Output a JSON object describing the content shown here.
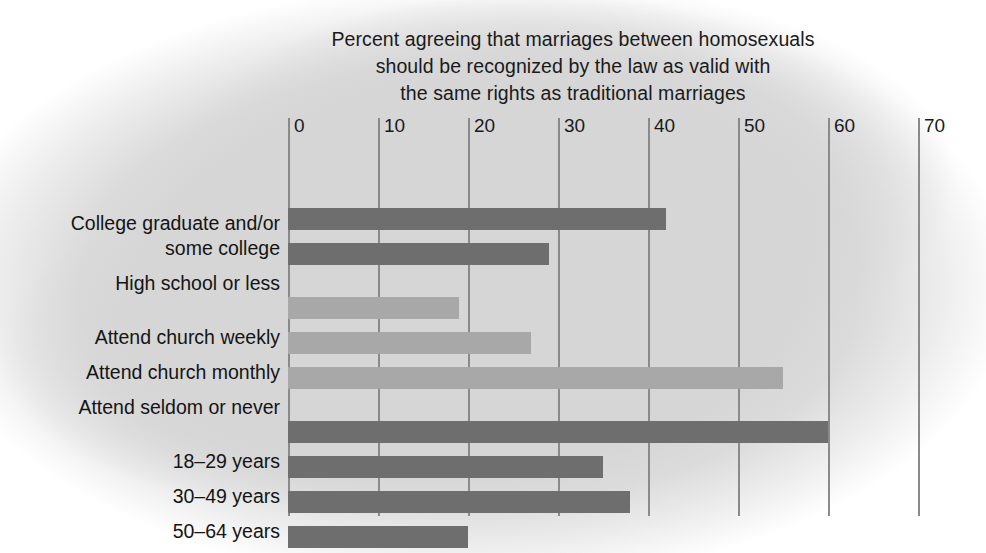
{
  "chart_data": {
    "type": "bar",
    "orientation": "horizontal",
    "title": "Percent agreeing that marriages between homosexuals should be recognized by the law as valid with the same rights as traditional marriages",
    "title_lines": [
      "Percent agreeing that marriages between homosexuals",
      "should be recognized by the law as valid with",
      "the same rights as traditional marriages"
    ],
    "xlabel": "",
    "ylabel": "",
    "xlim": [
      0,
      70
    ],
    "xticks": [
      0,
      10,
      20,
      30,
      40,
      50,
      60,
      70
    ],
    "xtick_labels": [
      "0",
      "10",
      "20",
      "30",
      "40",
      "50",
      "60",
      "70"
    ],
    "grid": "vertical",
    "legend": "none",
    "categories": [
      "College graduate and/or some college",
      "High school or less",
      "Attend church weekly",
      "Attend church monthly",
      "Attend seldom or never",
      "18–29 years",
      "30–49 years",
      "50–64 years",
      "65 years and older"
    ],
    "values": [
      42,
      29,
      19,
      27,
      55,
      60,
      35,
      38,
      20
    ],
    "bars": [
      {
        "label_lines": [
          "College graduate and/or",
          "some college"
        ],
        "value": 42,
        "group": "education",
        "shade": "dark"
      },
      {
        "label_lines": [
          "High school or less"
        ],
        "value": 29,
        "group": "education",
        "shade": "dark"
      },
      {
        "label_lines": [
          "Attend church weekly"
        ],
        "value": 19,
        "group": "church",
        "shade": "light"
      },
      {
        "label_lines": [
          "Attend church monthly"
        ],
        "value": 27,
        "group": "church",
        "shade": "light"
      },
      {
        "label_lines": [
          "Attend seldom or never"
        ],
        "value": 55,
        "group": "church",
        "shade": "light"
      },
      {
        "label_lines": [
          "18–29 years"
        ],
        "value": 60,
        "group": "age",
        "shade": "dark"
      },
      {
        "label_lines": [
          "30–49 years"
        ],
        "value": 35,
        "group": "age",
        "shade": "dark"
      },
      {
        "label_lines": [
          "50–64 years"
        ],
        "value": 38,
        "group": "age",
        "shade": "dark"
      },
      {
        "label_lines": [
          "65 years and older"
        ],
        "value": 20,
        "group": "age",
        "shade": "dark"
      }
    ],
    "colors": {
      "bar_dark": "#6e6e6e",
      "bar_light": "#a8a8a8",
      "gridline": "#8a8a8a",
      "background": "#d6d6d6",
      "text": "#1a1a1a"
    }
  }
}
